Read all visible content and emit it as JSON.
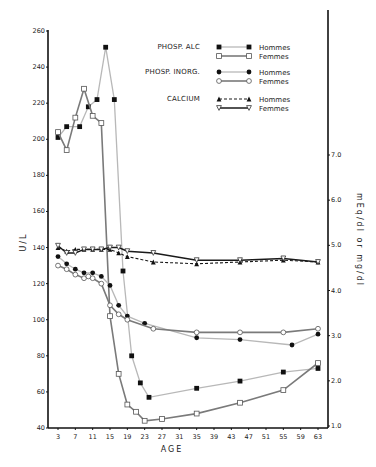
{
  "chart_data": {
    "type": "line",
    "title": "",
    "xlabel": "AGE",
    "ylabel_left": "U/L",
    "ylabel_right": "mEq/dl or mg/dl",
    "x_ticks": [
      3,
      7,
      11,
      15,
      19,
      23,
      27,
      31,
      35,
      39,
      43,
      47,
      51,
      55,
      59,
      63
    ],
    "ylim_left": [
      40,
      260
    ],
    "y_ticks_left": [
      40,
      60,
      80,
      100,
      120,
      140,
      160,
      180,
      200,
      220,
      240,
      260
    ],
    "ylim_right": [
      1.0,
      7.0
    ],
    "y_ticks_right": [
      "1.0",
      "2.0",
      "3.0",
      "4.0",
      "5.0",
      "6.0",
      "7.0"
    ],
    "grid": false,
    "legend_position": "top-right inside plot",
    "legend": [
      {
        "group": "PHOSP. ALC",
        "entries": [
          "Hommes",
          "Femmes"
        ]
      },
      {
        "group": "PHOSP. INORG.",
        "entries": [
          "Hommes",
          "Femmes"
        ]
      },
      {
        "group": "CALCIUM",
        "entries": [
          "Hommes",
          "Femmes"
        ]
      }
    ],
    "series": [
      {
        "name": "PHOSP. ALC Hommes",
        "axis": "left",
        "marker": "filled-square",
        "line": "light-gray",
        "x": [
          3,
          5,
          8,
          10,
          12,
          14,
          16,
          18,
          20,
          22,
          24,
          35,
          45,
          55,
          63
        ],
        "y": [
          201,
          207,
          207,
          218,
          222,
          251,
          222,
          127,
          80,
          65,
          57,
          62,
          66,
          71,
          73
        ]
      },
      {
        "name": "PHOSP. ALC Femmes",
        "axis": "left",
        "marker": "open-square",
        "line": "dark-gray",
        "x": [
          3,
          5,
          7,
          9,
          11,
          13,
          15,
          17,
          19,
          21,
          23,
          27,
          35,
          45,
          55,
          63
        ],
        "y": [
          204,
          194,
          212,
          228,
          213,
          209,
          102,
          70,
          53,
          49,
          44,
          45,
          48,
          54,
          61,
          76
        ]
      },
      {
        "name": "PHOSP. INORG. Hommes",
        "axis": "left",
        "marker": "filled-circle",
        "line": "light-gray",
        "x": [
          3,
          5,
          7,
          9,
          11,
          13,
          15,
          17,
          19,
          23,
          35,
          45,
          57,
          63
        ],
        "y": [
          135,
          131,
          128,
          126,
          126,
          124,
          119,
          108,
          102,
          98,
          90,
          89,
          86,
          92
        ]
      },
      {
        "name": "PHOSP. INORG. Femmes",
        "axis": "left",
        "marker": "open-circle",
        "line": "dark-gray",
        "x": [
          3,
          5,
          7,
          9,
          10,
          11,
          13,
          15,
          17,
          19,
          25,
          35,
          45,
          55,
          63
        ],
        "y": [
          130,
          128,
          125,
          123,
          124,
          123,
          120,
          108,
          103,
          100,
          95,
          93,
          93,
          93,
          95
        ]
      },
      {
        "name": "CALCIUM Hommes",
        "axis": "left",
        "marker": "filled-triangle",
        "line": "dashed-black",
        "x": [
          3,
          5,
          7,
          9,
          11,
          13,
          15,
          17,
          19,
          25,
          35,
          45,
          55,
          63
        ],
        "y": [
          140,
          138,
          139,
          139,
          139,
          139,
          139,
          137,
          135,
          132,
          131,
          132,
          133,
          132
        ]
      },
      {
        "name": "CALCIUM Femmes",
        "axis": "left",
        "marker": "open-triangle-down",
        "line": "solid-black",
        "x": [
          3,
          5,
          7,
          9,
          11,
          13,
          15,
          17,
          19,
          25,
          35,
          45,
          55,
          63
        ],
        "y": [
          141,
          137,
          137,
          139,
          139,
          139,
          140,
          140,
          138,
          137,
          133,
          133,
          134,
          132
        ]
      }
    ]
  },
  "colors": {
    "axis": "#111111",
    "light_line": "#b8b8b8",
    "dark_line": "#7a7a7a",
    "black_line": "#1a1a1a"
  }
}
